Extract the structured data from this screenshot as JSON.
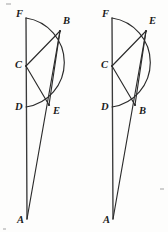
{
  "image": {
    "kind": "geometry-diagram-pair",
    "width": 168,
    "height": 232,
    "background_color": "#fdfdfc",
    "ink_color": "#2b2b2b"
  },
  "figures": [
    {
      "id": "left-figure",
      "name": "left-geometric-figure",
      "description": "Vertical segment F-C-D-A with semicircular arc F to D bulging right; chords C-B, C-E, B-E; long line B-A",
      "points": [
        {
          "key": "F",
          "label": "F",
          "x": 26,
          "y": 18,
          "label_x": 16,
          "label_y": 17
        },
        {
          "key": "B",
          "label": "B",
          "x": 60,
          "y": 31,
          "label_x": 63,
          "label_y": 24
        },
        {
          "key": "C",
          "label": "C",
          "x": 26,
          "y": 66,
          "label_x": 15,
          "label_y": 68
        },
        {
          "key": "D",
          "label": "D",
          "x": 26,
          "y": 107,
          "label_x": 15,
          "label_y": 110
        },
        {
          "key": "E",
          "label": "E",
          "x": 49,
          "y": 105,
          "label_x": 53,
          "label_y": 114
        },
        {
          "key": "A",
          "label": "A",
          "x": 27,
          "y": 219,
          "label_x": 17,
          "label_y": 223
        }
      ],
      "segments": [
        {
          "name": "segment-F-A",
          "from": "F",
          "to": "A"
        },
        {
          "name": "segment-C-B",
          "from": "C",
          "to": "B"
        },
        {
          "name": "segment-C-E",
          "from": "C",
          "to": "E"
        },
        {
          "name": "segment-B-E",
          "from": "B",
          "to": "E"
        },
        {
          "name": "segment-B-A",
          "from": "B",
          "to": "A"
        }
      ],
      "arc": {
        "name": "arc-F-D",
        "from": "F",
        "to": "D",
        "radius": 45,
        "bulge": "right",
        "path": "M 26 18 A 45 45 0 0 1 26 107"
      }
    },
    {
      "id": "right-figure",
      "name": "right-geometric-figure",
      "description": "Same construction with labels B and E swapped: E on upper arc, B on lower arc",
      "points": [
        {
          "key": "F",
          "label": "F",
          "x": 112,
          "y": 18,
          "label_x": 102,
          "label_y": 17
        },
        {
          "key": "E",
          "label": "E",
          "x": 146,
          "y": 31,
          "label_x": 149,
          "label_y": 24
        },
        {
          "key": "C",
          "label": "C",
          "x": 112,
          "y": 66,
          "label_x": 101,
          "label_y": 68
        },
        {
          "key": "D",
          "label": "D",
          "x": 112,
          "y": 107,
          "label_x": 101,
          "label_y": 110
        },
        {
          "key": "B",
          "label": "B",
          "x": 135,
          "y": 105,
          "label_x": 139,
          "label_y": 114
        },
        {
          "key": "A",
          "label": "A",
          "x": 113,
          "y": 219,
          "label_x": 103,
          "label_y": 223
        }
      ],
      "segments": [
        {
          "name": "segment-F-A",
          "from": "F",
          "to": "A"
        },
        {
          "name": "segment-C-E",
          "from": "C",
          "to": "E"
        },
        {
          "name": "segment-C-B",
          "from": "C",
          "to": "B"
        },
        {
          "name": "segment-E-B",
          "from": "E",
          "to": "B"
        },
        {
          "name": "segment-E-A",
          "from": "E",
          "to": "A"
        }
      ],
      "arc": {
        "name": "arc-F-D",
        "from": "F",
        "to": "D",
        "radius": 45,
        "bulge": "right",
        "path": "M 112 18 A 45 45 0 0 1 112 107"
      }
    }
  ]
}
